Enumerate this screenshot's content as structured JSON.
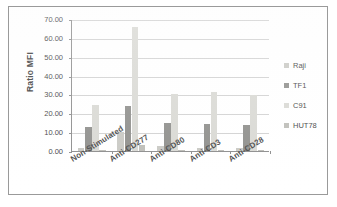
{
  "chart_data": {
    "type": "bar",
    "title": "",
    "xlabel": "",
    "ylabel": "Ratio MFI",
    "ylim": [
      0,
      70
    ],
    "ytick_step": 10,
    "ytick_labels": [
      "70.00",
      "60.00",
      "50.00",
      "40.00",
      "30.00",
      "20.00",
      "10.00",
      "0.00"
    ],
    "ytick_values": [
      70,
      60,
      50,
      40,
      30,
      20,
      10,
      0
    ],
    "grid": true,
    "legend_position": "right",
    "categories": [
      "Non-Stimulated",
      "Anti-CD277",
      "Anti-CD80",
      "Anti-CD3",
      "Anti-CD28"
    ],
    "series": [
      {
        "name": "Raji",
        "color": "#c9c9c4",
        "values": [
          1.7,
          10.3,
          2.5,
          1.8,
          1.8
        ]
      },
      {
        "name": "TF1",
        "color": "#8f8f8c",
        "values": [
          12.8,
          24.0,
          14.8,
          14.2,
          13.7
        ]
      },
      {
        "name": "C91",
        "color": "#d9d9d4",
        "values": [
          24.5,
          65.8,
          30.1,
          31.3,
          29.5
        ]
      },
      {
        "name": "HUT78",
        "color": "#bdbdb8",
        "values": [
          0.7,
          3.2,
          0.7,
          0.5,
          0.6
        ]
      }
    ]
  },
  "legend": {
    "items": [
      {
        "label": "Raji"
      },
      {
        "label": "TF1"
      },
      {
        "label": "C91"
      },
      {
        "label": "HUT78"
      }
    ]
  },
  "axis": {
    "y_title": "Ratio MFI"
  },
  "colors": {
    "frame": "#9a9a9a",
    "axis": "#8d8d8d",
    "gridline": "#d2d2d2",
    "text": "#3f3f3f",
    "background": "#ffffff"
  }
}
